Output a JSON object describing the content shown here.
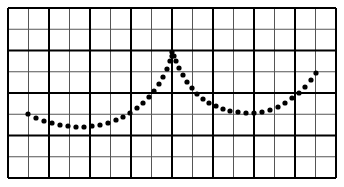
{
  "chart_data": {
    "type": "scatter",
    "title": "",
    "xlabel": "",
    "ylabel": "",
    "grid": true,
    "grid_minor_columns": 16,
    "grid_minor_rows": 8,
    "grid_major_every": 2,
    "plot_box_px": {
      "left": 8,
      "top": 8,
      "right": 336,
      "bottom": 178
    },
    "points_px": [
      [
        28,
        114
      ],
      [
        36,
        118
      ],
      [
        44,
        121
      ],
      [
        52,
        123
      ],
      [
        60,
        125
      ],
      [
        68,
        126
      ],
      [
        76,
        127
      ],
      [
        84,
        127
      ],
      [
        92,
        126
      ],
      [
        100,
        125
      ],
      [
        108,
        123
      ],
      [
        116,
        120
      ],
      [
        123,
        117
      ],
      [
        130,
        113
      ],
      [
        137,
        108
      ],
      [
        143,
        103
      ],
      [
        149,
        97
      ],
      [
        154,
        91
      ],
      [
        159,
        84
      ],
      [
        163,
        77
      ],
      [
        167,
        69
      ],
      [
        170,
        61
      ],
      [
        172,
        56
      ],
      [
        174,
        56
      ],
      [
        172,
        52
      ],
      [
        176,
        61
      ],
      [
        179,
        68
      ],
      [
        183,
        75
      ],
      [
        187,
        82
      ],
      [
        192,
        88
      ],
      [
        197,
        94
      ],
      [
        203,
        99
      ],
      [
        209,
        103
      ],
      [
        216,
        106
      ],
      [
        223,
        109
      ],
      [
        230,
        111
      ],
      [
        238,
        112
      ],
      [
        246,
        113
      ],
      [
        254,
        113
      ],
      [
        262,
        112
      ],
      [
        270,
        110
      ],
      [
        278,
        107
      ],
      [
        285,
        103
      ],
      [
        292,
        98
      ],
      [
        299,
        93
      ],
      [
        305,
        87
      ],
      [
        311,
        80
      ],
      [
        316,
        73
      ]
    ]
  },
  "colors": {
    "background": "#ffffff",
    "grid_minor": "#555555",
    "grid_major": "#000000",
    "dots": "#000000"
  }
}
